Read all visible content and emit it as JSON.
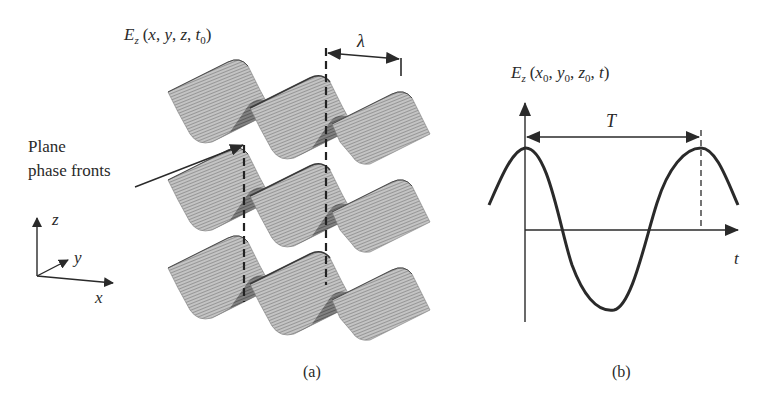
{
  "panel_a": {
    "field_label": {
      "symbol": "E",
      "subscript": "z",
      "args_open": "(",
      "x": "x",
      "y": "y",
      "z": "z",
      "t": "t",
      "t_sub": "0",
      "sep": ", ",
      "args_close": ")"
    },
    "wavelength_label": "λ",
    "phase_fronts_label_line1": "Plane",
    "phase_fronts_label_line2": "phase fronts",
    "axes": {
      "z": "z",
      "y": "y",
      "x": "x"
    },
    "caption": "(a)",
    "rows": 3,
    "peaks_per_row": 3
  },
  "panel_b": {
    "field_label": {
      "symbol": "E",
      "subscript": "z",
      "args_open": "(",
      "x": "x",
      "x_sub": "0",
      "y": "y",
      "y_sub": "0",
      "z": "z",
      "z_sub": "0",
      "t": "t",
      "sep": ", ",
      "args_close": ")"
    },
    "period_label": "T",
    "time_axis_label": "t",
    "caption": "(b)"
  },
  "colors": {
    "ink": "#2a2a2a",
    "surface_light": "#bdbdbd",
    "surface_dark": "#6e6e6e",
    "background": "#ffffff"
  }
}
